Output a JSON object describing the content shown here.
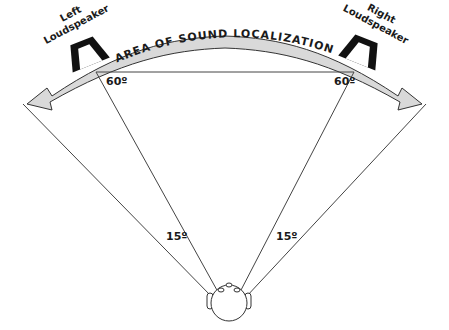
{
  "diagram": {
    "arc_label": "AREA OF SOUND LOCALIZATION",
    "left_speaker": {
      "line1": "Left",
      "line2": "Loudspeaker"
    },
    "right_speaker": {
      "line1": "Right",
      "line2": "Loudspeaker"
    },
    "angles": {
      "left_speaker_angle": "60º",
      "right_speaker_angle": "60º",
      "left_extension_angle": "15º",
      "right_extension_angle": "15º"
    },
    "colors": {
      "arc_fill": "#d9d9d9",
      "line": "#333333",
      "speaker": "#111111"
    }
  }
}
